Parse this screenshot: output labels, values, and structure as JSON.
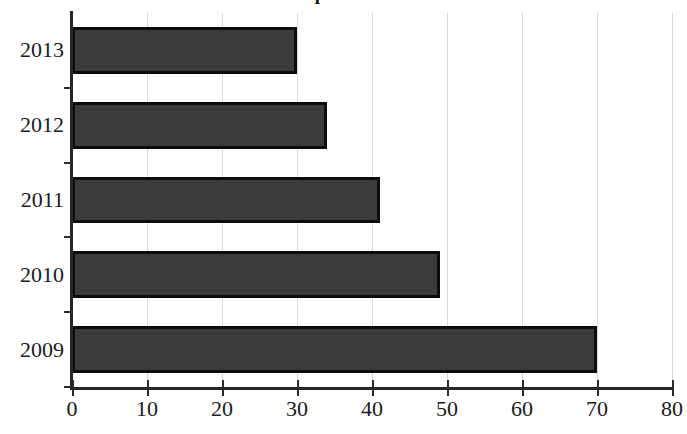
{
  "chart_data": {
    "type": "bar",
    "orientation": "horizontal",
    "title": "rate per 100 000",
    "xlabel": "",
    "ylabel": "",
    "categories": [
      "2013",
      "2012",
      "2011",
      "2010",
      "2009"
    ],
    "values": [
      30,
      34,
      41,
      49,
      70
    ],
    "xlim": [
      0,
      80
    ],
    "xticks": [
      0,
      10,
      20,
      30,
      40,
      50,
      60,
      70,
      80
    ],
    "xtick_labels": [
      "0",
      "10",
      "20",
      "30",
      "40",
      "50",
      "60",
      "70",
      "80"
    ],
    "grid": "vertical",
    "legend": null,
    "bar_color": "#3b3b3b",
    "bar_edge_color": "#0d0d0d",
    "gridline_color": "#d9d9d9",
    "axis_color": "#262626"
  }
}
